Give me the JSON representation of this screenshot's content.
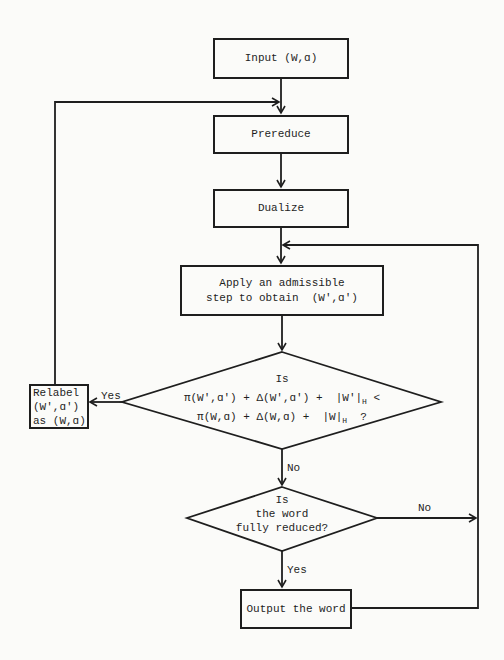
{
  "flowchart": {
    "input": "Input (W,ɑ)",
    "prereduce": "Prereduce",
    "dualize": "Dualize",
    "apply": {
      "line1": "Apply an admissible",
      "line2": "step to obtain  (W',ɑ')"
    },
    "decision1": {
      "line1": "Is",
      "line2_a": "π(W',ɑ') + Δ(W',ɑ') +  |W'|",
      "line2_sub": "H",
      "line2_b": " <",
      "line3_a": "π(W,ɑ) + Δ(W,ɑ) +  |W|",
      "line3_sub": "H",
      "line3_b": "  ?",
      "yes_label": "Yes",
      "no_label": "No"
    },
    "relabel": {
      "line1": "Relabel",
      "line2": "(W',ɑ')",
      "line3": "as (W,ɑ)"
    },
    "decision2": {
      "line1": "Is",
      "line2": "the word",
      "line3": "fully reduced?",
      "yes_label": "Yes",
      "no_label": "No"
    },
    "output": "Output the word"
  }
}
